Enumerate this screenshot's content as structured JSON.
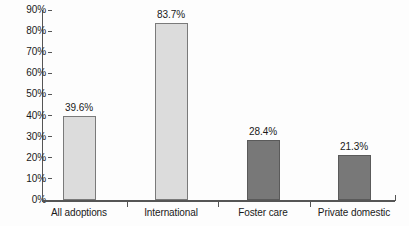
{
  "chart_data": {
    "type": "bar",
    "title": "",
    "xlabel": "",
    "ylabel": "",
    "ylim": [
      0,
      90
    ],
    "grid": false,
    "legend": "none",
    "categories": [
      "All adoptions",
      "International",
      "Foster care",
      "Private domestic"
    ],
    "values": [
      39.6,
      83.7,
      28.4,
      21.3
    ],
    "value_labels": [
      "39.6%",
      "83.7%",
      "28.4%",
      "21.3%"
    ],
    "bar_colors": [
      "#dcdcdc",
      "#dcdcdc",
      "#787878",
      "#787878"
    ],
    "y_ticks": [
      0,
      10,
      20,
      30,
      40,
      50,
      60,
      70,
      80,
      90
    ],
    "y_tick_labels": [
      "0%",
      "10%",
      "20%",
      "30%",
      "40%",
      "50%",
      "60%",
      "70%",
      "80%",
      "90%"
    ]
  },
  "style": {
    "axis_color": "#555555",
    "light_fill": "#dcdcdc",
    "dark_fill": "#787878",
    "text_color": "#1a1a1a",
    "background": "#fdfdfd"
  }
}
